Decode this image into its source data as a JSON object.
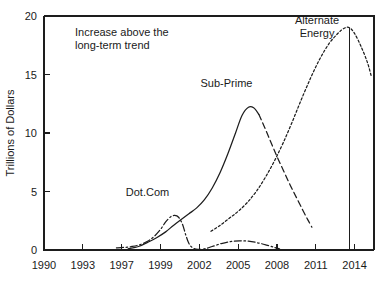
{
  "chart_data": {
    "type": "line",
    "title": "",
    "xlabel": "",
    "ylabel": "Trillions of Dollars",
    "xlim": [
      1990,
      2015.5
    ],
    "ylim": [
      0,
      20
    ],
    "grid": false,
    "legend_position": "none",
    "x_ticks": [
      {
        "value": 1990,
        "label": "1990"
      },
      {
        "value": 1993,
        "label": "1993"
      },
      {
        "value": 1996,
        "label": "1997"
      },
      {
        "value": 1999,
        "label": "1999"
      },
      {
        "value": 2002,
        "label": "2002"
      },
      {
        "value": 2005,
        "label": "2005"
      },
      {
        "value": 2008,
        "label": "2008"
      },
      {
        "value": 2011,
        "label": "2011"
      },
      {
        "value": 2014,
        "label": "2014"
      }
    ],
    "y_ticks": [
      {
        "value": 0,
        "label": "0"
      },
      {
        "value": 5,
        "label": "5"
      },
      {
        "value": 10,
        "label": "10"
      },
      {
        "value": 15,
        "label": "15"
      },
      {
        "value": 20,
        "label": "20"
      }
    ],
    "series": [
      {
        "name": "Dot.Com",
        "style": "dashdot",
        "label": "Dot.Com",
        "label_x": 1998.0,
        "label_y": 4.6,
        "points": [
          [
            1995.6,
            0.18
          ],
          [
            1996.2,
            0.22
          ],
          [
            1996.8,
            0.3
          ],
          [
            1997.4,
            0.45
          ],
          [
            1998.0,
            0.75
          ],
          [
            1998.5,
            1.15
          ],
          [
            1999.0,
            1.75
          ],
          [
            1999.4,
            2.4
          ],
          [
            1999.8,
            2.85
          ],
          [
            2000.1,
            2.95
          ],
          [
            2000.4,
            2.8
          ],
          [
            2000.7,
            2.2
          ],
          [
            2000.95,
            1.3
          ],
          [
            2001.2,
            0.55
          ],
          [
            2001.5,
            0.18
          ],
          [
            2001.9,
            0.05
          ],
          [
            2002.4,
            0.1
          ],
          [
            2003.0,
            0.3
          ],
          [
            2003.7,
            0.55
          ],
          [
            2004.4,
            0.72
          ],
          [
            2005.1,
            0.78
          ],
          [
            2005.8,
            0.75
          ],
          [
            2006.5,
            0.62
          ],
          [
            2007.2,
            0.42
          ],
          [
            2007.8,
            0.22
          ],
          [
            2008.2,
            0.1
          ]
        ]
      },
      {
        "name": "Sub-Prime",
        "style": "solid",
        "label": "Sub-Prime",
        "label_x": 2004.1,
        "label_y": 13.9,
        "points": [
          [
            1996.5,
            0.1
          ],
          [
            1997.3,
            0.3
          ],
          [
            1998.0,
            0.65
          ],
          [
            1998.7,
            1.05
          ],
          [
            1999.4,
            1.55
          ],
          [
            2000.0,
            2.1
          ],
          [
            2000.6,
            2.6
          ],
          [
            2001.2,
            3.1
          ],
          [
            2001.8,
            3.6
          ],
          [
            2002.4,
            4.3
          ],
          [
            2003.0,
            5.3
          ],
          [
            2003.6,
            6.6
          ],
          [
            2004.2,
            8.2
          ],
          [
            2004.8,
            10.0
          ],
          [
            2005.3,
            11.5
          ],
          [
            2005.8,
            12.2
          ],
          [
            2006.2,
            12.15
          ],
          [
            2006.6,
            11.6
          ]
        ]
      },
      {
        "name": "Sub-Prime decline",
        "style": "dashed",
        "label": "",
        "label_x": 0,
        "label_y": 0,
        "points": [
          [
            2006.6,
            11.6
          ],
          [
            2007.0,
            10.6
          ],
          [
            2007.5,
            9.3
          ],
          [
            2008.0,
            8.0
          ],
          [
            2008.5,
            6.8
          ],
          [
            2009.0,
            5.6
          ],
          [
            2009.5,
            4.5
          ],
          [
            2010.0,
            3.4
          ],
          [
            2010.4,
            2.55
          ],
          [
            2010.7,
            1.95
          ]
        ]
      },
      {
        "name": "Alternate Energy",
        "style": "dotted",
        "label": "Alternate\nEnergy",
        "label_x": 2011.1,
        "label_y": 19.3,
        "points": [
          [
            2002.9,
            1.6
          ],
          [
            2003.6,
            2.1
          ],
          [
            2004.3,
            2.7
          ],
          [
            2005.0,
            3.3
          ],
          [
            2005.7,
            4.05
          ],
          [
            2006.4,
            5.0
          ],
          [
            2007.1,
            6.2
          ],
          [
            2007.8,
            7.6
          ],
          [
            2008.5,
            9.2
          ],
          [
            2009.2,
            11.0
          ],
          [
            2009.9,
            12.9
          ],
          [
            2010.6,
            14.7
          ],
          [
            2011.3,
            16.3
          ],
          [
            2012.0,
            17.6
          ],
          [
            2012.7,
            18.5
          ],
          [
            2013.2,
            18.95
          ],
          [
            2013.6,
            19.0
          ],
          [
            2014.0,
            18.5
          ],
          [
            2014.5,
            17.4
          ],
          [
            2015.0,
            16.0
          ],
          [
            2015.3,
            14.8
          ]
        ]
      }
    ],
    "marker_line": {
      "name": "peak-marker",
      "x": 2013.6,
      "y_from": 0,
      "y_to": 19.0
    },
    "annotations": [
      {
        "name": "increase-note",
        "lines": [
          "Increase above the",
          "long-term trend"
        ],
        "x": 1992.4,
        "y": 18.3
      }
    ]
  }
}
